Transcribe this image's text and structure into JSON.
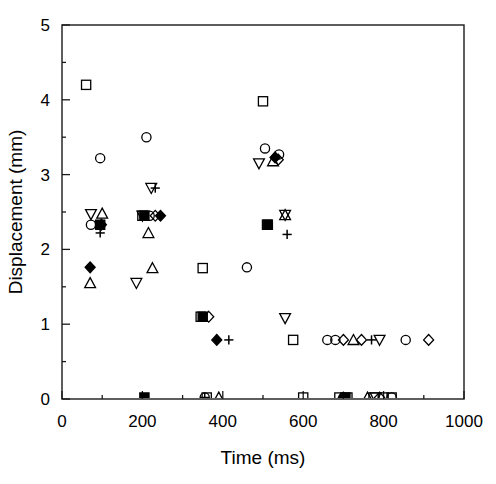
{
  "chart_data": {
    "type": "scatter",
    "title": "",
    "xlabel": "Time (ms)",
    "ylabel": "Displacement (mm)",
    "xlim": [
      0,
      1000
    ],
    "ylim": [
      0,
      5
    ],
    "xticks": [
      0,
      200,
      400,
      600,
      800,
      1000
    ],
    "xtick_labels": [
      "0",
      "200",
      "400",
      "600",
      "800",
      "1000"
    ],
    "xminor_step": 100,
    "yticks": [
      0,
      1,
      2,
      3,
      4,
      5
    ],
    "ytick_labels": [
      "0",
      "1",
      "2",
      "3",
      "4",
      "5"
    ],
    "yminor_step": 0.5,
    "grid": false,
    "legend": "none",
    "marker_types": [
      "square",
      "circle",
      "triangle-up",
      "triangle-down",
      "diamond",
      "plus",
      "filled-diamond",
      "filled-square"
    ],
    "series": [
      {
        "name": "square",
        "marker": "square",
        "points": [
          [
            60,
            4.2
          ],
          [
            200,
            2.45
          ],
          [
            345,
            1.1
          ],
          [
            350,
            1.75
          ],
          [
            500,
            3.98
          ],
          [
            510,
            2.33
          ],
          [
            575,
            0.79
          ],
          [
            600,
            0.02
          ],
          [
            690,
            0.02
          ],
          [
            710,
            0.02
          ],
          [
            775,
            0.02
          ],
          [
            800,
            0.02
          ],
          [
            360,
            0.02
          ],
          [
            820,
            0.02
          ]
        ]
      },
      {
        "name": "circle",
        "marker": "circle",
        "points": [
          [
            72,
            2.33
          ],
          [
            95,
            3.22
          ],
          [
            210,
            3.5
          ],
          [
            218,
            2.45
          ],
          [
            505,
            3.35
          ],
          [
            540,
            3.27
          ],
          [
            460,
            1.76
          ],
          [
            660,
            0.79
          ],
          [
            680,
            0.79
          ],
          [
            855,
            0.79
          ],
          [
            355,
            0.02
          ],
          [
            700,
            0.02
          ],
          [
            820,
            0.02
          ]
        ]
      },
      {
        "name": "triangle-up",
        "marker": "triangle-up",
        "points": [
          [
            100,
            2.48
          ],
          [
            70,
            1.55
          ],
          [
            215,
            2.22
          ],
          [
            225,
            1.75
          ],
          [
            525,
            3.18
          ],
          [
            555,
            2.46
          ],
          [
            725,
            0.79
          ],
          [
            390,
            0.02
          ],
          [
            760,
            0.02
          ]
        ]
      },
      {
        "name": "triangle-down",
        "marker": "triangle-down",
        "points": [
          [
            72,
            2.47
          ],
          [
            200,
            2.45
          ],
          [
            222,
            2.82
          ],
          [
            185,
            1.55
          ],
          [
            490,
            3.15
          ],
          [
            555,
            2.46
          ],
          [
            555,
            1.08
          ],
          [
            790,
            0.79
          ],
          [
            780,
            0.02
          ]
        ]
      },
      {
        "name": "diamond",
        "marker": "diamond",
        "points": [
          [
            232,
            2.45
          ],
          [
            365,
            1.1
          ],
          [
            538,
            3.2
          ],
          [
            700,
            0.79
          ],
          [
            745,
            0.79
          ],
          [
            912,
            0.79
          ],
          [
            790,
            0.02
          ]
        ]
      },
      {
        "name": "plus",
        "marker": "plus",
        "points": [
          [
            95,
            2.22
          ],
          [
            232,
            2.82
          ],
          [
            560,
            2.2
          ],
          [
            415,
            0.79
          ],
          [
            770,
            0.79
          ],
          [
            355,
            0.02
          ]
        ]
      },
      {
        "name": "filled-diamond",
        "marker": "filled-diamond",
        "points": [
          [
            70,
            1.76
          ],
          [
            385,
            0.79
          ],
          [
            530,
            3.23
          ],
          [
            98,
            2.33
          ],
          [
            245,
            2.45
          ],
          [
            700,
            0.02
          ]
        ]
      },
      {
        "name": "filled-square",
        "marker": "filled-square",
        "points": [
          [
            95,
            2.33
          ],
          [
            205,
            2.45
          ],
          [
            350,
            1.1
          ],
          [
            512,
            2.33
          ],
          [
            205,
            0.02
          ],
          [
            705,
            0.02
          ]
        ]
      }
    ]
  },
  "axes": {
    "x_title": "Time (ms)",
    "y_title": "Displacement (mm)"
  }
}
